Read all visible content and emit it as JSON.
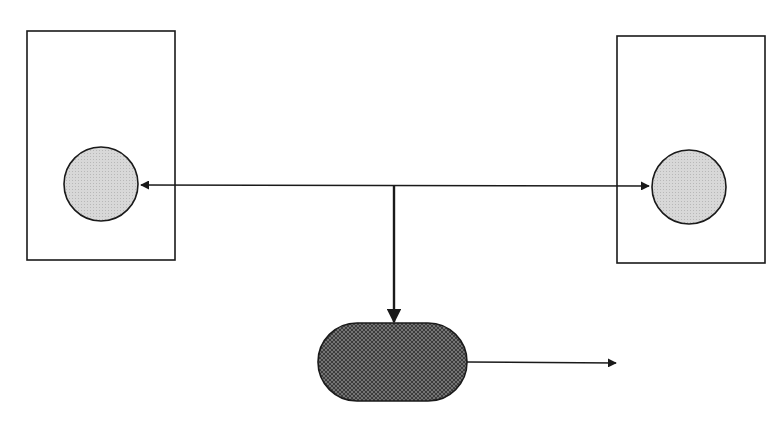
{
  "diagram": {
    "type": "block-diagram",
    "colors": {
      "background": "#ffffff",
      "stroke": "#1a1a1a",
      "circle_fill": "#d4d4d4",
      "pill_fill": "#3a3a3a",
      "pill_hatch": "#8a8a8a"
    },
    "nodes": [
      {
        "id": "left-box",
        "shape": "rectangle",
        "x": 27,
        "y": 31,
        "w": 148,
        "h": 229
      },
      {
        "id": "left-circle",
        "shape": "circle",
        "cx": 101,
        "cy": 184,
        "r": 37,
        "parent": "left-box"
      },
      {
        "id": "right-box",
        "shape": "rectangle",
        "x": 617,
        "y": 36,
        "w": 148,
        "h": 227
      },
      {
        "id": "right-circle",
        "shape": "circle",
        "cx": 689,
        "cy": 187,
        "r": 37,
        "parent": "right-box"
      },
      {
        "id": "center-pill",
        "shape": "rounded-rectangle",
        "x": 318,
        "y": 323,
        "w": 149,
        "h": 78,
        "rx": 39
      }
    ],
    "edges": [
      {
        "id": "link-to-left",
        "from": "junction",
        "to": "left-circle",
        "arrow": "end"
      },
      {
        "id": "link-to-right",
        "from": "junction",
        "to": "right-circle",
        "arrow": "end"
      },
      {
        "id": "link-down",
        "from": "junction",
        "to": "center-pill",
        "arrow": "end"
      },
      {
        "id": "output",
        "from": "center-pill",
        "to": "outside-right",
        "arrow": "end"
      }
    ]
  }
}
